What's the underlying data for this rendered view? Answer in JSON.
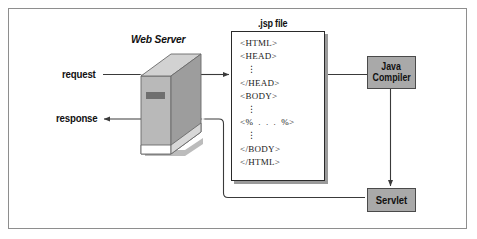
{
  "figure": {
    "type": "diagram",
    "border_color": "#8e8e8e",
    "background": "#ffffff"
  },
  "labels": {
    "web_server": "Web Server",
    "jsp_file": ".jsp file",
    "request": "request",
    "response": "response"
  },
  "boxes": {
    "java_compiler": {
      "line1": "Java",
      "line2": "Compiler",
      "fill": "#a9a9a9",
      "stroke": "#4a4a4a"
    },
    "servlet": {
      "line1": "Servlet",
      "fill": "#a9a9a9",
      "stroke": "#4a4a4a"
    }
  },
  "jsp_file": {
    "caption": ".jsp file",
    "code_lines": [
      "<HTML>",
      "<HEAD>",
      "⋮",
      "</HEAD>",
      "<BODY>",
      "⋮",
      "<%  .  .  .  %>",
      "⋮",
      "</BODY>",
      "</HTML>"
    ]
  },
  "connections": [
    {
      "name": "request-arrow",
      "from": "request",
      "to": "jsp file",
      "style": "solid-arrow",
      "passes_through": "Web Server"
    },
    {
      "name": "response-arrow",
      "from": "Servlet",
      "to": "response",
      "style": "solid-arrow",
      "passes_through": "Web Server"
    },
    {
      "name": "jsp-to-compiler",
      "from": ".jsp file",
      "to": "Java Compiler",
      "style": "solid-line"
    },
    {
      "name": "compiler-to-servlet",
      "from": "Java Compiler",
      "to": "Servlet",
      "style": "solid-arrow"
    }
  ],
  "colors": {
    "box_fill": "#a9a9a9",
    "box_stroke": "#4a4a4a",
    "line": "#3a3a3a",
    "server_light": "#cfcfcf",
    "server_mid": "#b4b4b4",
    "server_dark": "#9a9a9a",
    "shadow": "#9a9a9a"
  }
}
